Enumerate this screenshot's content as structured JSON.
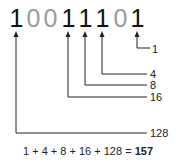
{
  "diagram": {
    "binary_digits": [
      "1",
      "0",
      "0",
      "1",
      "1",
      "1",
      "0",
      "1"
    ],
    "digit_states": [
      "on",
      "off",
      "off",
      "on",
      "on",
      "on",
      "off",
      "on"
    ],
    "place_values": [
      {
        "bit_index": 7,
        "label": "128"
      },
      {
        "bit_index": 4,
        "label": "16"
      },
      {
        "bit_index": 3,
        "label": "8"
      },
      {
        "bit_index": 2,
        "label": "4"
      },
      {
        "bit_index": 0,
        "label": "1"
      }
    ],
    "equation_terms": "1 + 4 + 8 + 16 + 128 =",
    "equation_result": "157"
  }
}
